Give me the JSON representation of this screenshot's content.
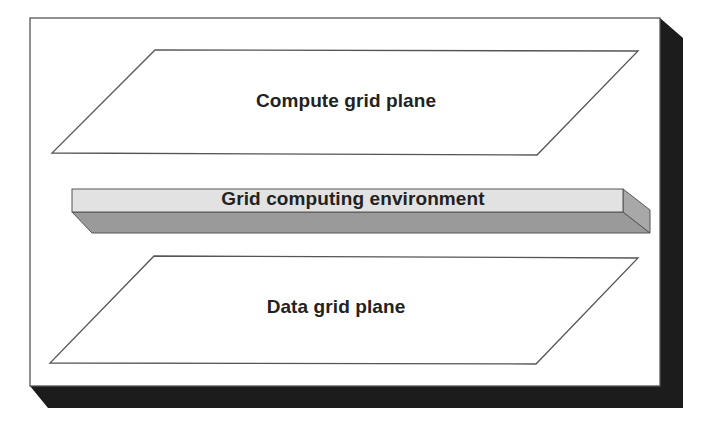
{
  "diagram": {
    "planes": [
      {
        "id": "compute",
        "label": "Compute grid plane"
      },
      {
        "id": "environment",
        "label": "Grid computing environment"
      },
      {
        "id": "data",
        "label": "Data grid plane"
      }
    ]
  },
  "colors": {
    "background": "#ffffff",
    "frame_stroke": "#555555",
    "shadow": "#1c1c1c",
    "plane_stroke": "#555555",
    "slab_top": "#e2e2e2",
    "slab_front": "#9a9a9a",
    "slab_side": "#a8a8a8",
    "text": "#222222"
  }
}
